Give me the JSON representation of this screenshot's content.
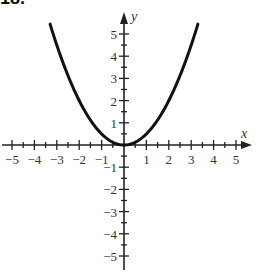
{
  "problem": {
    "label": "18."
  },
  "chart_data": {
    "type": "line",
    "title": "",
    "function": "y = x^2 / 2",
    "xlabel": "x",
    "ylabel": "y",
    "xlim": [
      -5,
      5
    ],
    "ylim": [
      -5,
      5
    ],
    "grid": false,
    "legend": null,
    "x_ticks": [
      -5,
      -4,
      -3,
      -2,
      -1,
      1,
      2,
      3,
      4,
      5
    ],
    "y_ticks": [
      -5,
      -4,
      -3,
      -2,
      -1,
      1,
      2,
      3,
      4,
      5
    ],
    "minor_ticks_step": 0.5,
    "series": [
      {
        "name": "parabola",
        "x": [
          -3.3,
          -3,
          -2.5,
          -2,
          -1.5,
          -1,
          -0.5,
          0,
          0.5,
          1,
          1.5,
          2,
          2.5,
          3,
          3.3
        ],
        "values": [
          5.445,
          4.5,
          3.125,
          2,
          1.125,
          0.5,
          0.125,
          0,
          0.125,
          0.5,
          1.125,
          2,
          3.125,
          4.5,
          5.445
        ]
      }
    ],
    "colors": {
      "curve": "#111111",
      "axes": "#222222",
      "labels": "#333333"
    }
  }
}
